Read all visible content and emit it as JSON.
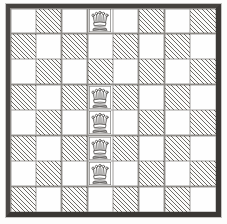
{
  "figure": {
    "board": {
      "rows": 8,
      "columns": 8,
      "light_square_color": "#fefefe",
      "dark_square_color": "#6e6b67",
      "dark_square_style": "diagonal-hatching",
      "frame_color": "#45423e",
      "grid_line_color": "#8d8a86"
    },
    "squares": [
      [
        "light",
        "hatched",
        "light",
        "light",
        "light",
        "hatched",
        "light",
        "hatched"
      ],
      [
        "hatched",
        "light",
        "hatched",
        "light",
        "hatched",
        "light",
        "hatched",
        "light"
      ],
      [
        "light",
        "hatched",
        "light",
        "hatched",
        "light",
        "hatched",
        "light",
        "hatched"
      ],
      [
        "hatched",
        "light",
        "hatched",
        "light",
        "hatched",
        "light",
        "hatched",
        "light"
      ],
      [
        "light",
        "hatched",
        "light",
        "light",
        "light",
        "hatched",
        "light",
        "hatched"
      ],
      [
        "hatched",
        "light",
        "hatched",
        "light",
        "hatched",
        "light",
        "hatched",
        "light"
      ],
      [
        "light",
        "hatched",
        "light",
        "light",
        "light",
        "hatched",
        "light",
        "hatched"
      ],
      [
        "hatched",
        "light",
        "hatched",
        "light",
        "hatched",
        "light",
        "hatched",
        "light"
      ]
    ],
    "pieces": [
      {
        "type": "queen",
        "row": 0,
        "col": 3,
        "name": "queen-piece"
      },
      {
        "type": "queen",
        "row": 3,
        "col": 3,
        "name": "queen-piece"
      },
      {
        "type": "queen",
        "row": 4,
        "col": 3,
        "name": "queen-piece"
      },
      {
        "type": "queen",
        "row": 5,
        "col": 3,
        "name": "queen-piece"
      },
      {
        "type": "queen",
        "row": 6,
        "col": 3,
        "name": "queen-piece"
      }
    ],
    "piece_count": 5,
    "piece_icon": "queen-crown-icon"
  }
}
